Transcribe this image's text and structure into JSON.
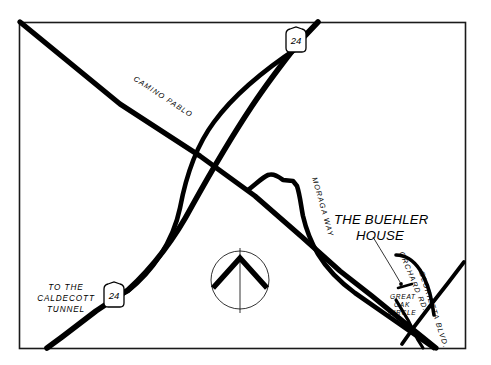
{
  "map": {
    "title": "The Buehler House Location Map",
    "background_color": "#ffffff",
    "ink_color": "#000000",
    "border_color": "#1a1a1a",
    "place_label": {
      "line1": "THE BUEHLER",
      "line2": "HOUSE"
    },
    "destination_label": {
      "line1": "TO THE",
      "line2": "CALDECOTT",
      "line3": "TUNNEL"
    },
    "roads": [
      {
        "id": "camino-pablo",
        "name": "CAMINO PABLO",
        "label": "CAMINO PABLO"
      },
      {
        "id": "highway-24",
        "name": "HIGHWAY 24",
        "label": "24"
      },
      {
        "id": "moraga-way",
        "name": "MORAGA WAY",
        "label": "MORAGA WAY"
      },
      {
        "id": "orchard-rd",
        "name": "ORCHARD RD.",
        "label": "ORCHARD RD."
      },
      {
        "id": "glorietta-blvd",
        "name": "GLORIETTA BLVD.",
        "label": "GLORIETTA BLVD."
      },
      {
        "id": "great-oak-circle",
        "name": "GREAT OAK CIRCLE",
        "label": "GREAT\nOAK\nCIRCLE"
      }
    ],
    "street_labels": {
      "camino_pablo": "CAMINO PABLO",
      "moraga_way": "MORAGA WAY",
      "orchard_rd": "ORCHARD RD.",
      "glorietta_blvd": "GLORIETTA BLVD.",
      "great_oak_circle_line1": "GREAT",
      "great_oak_circle_line2": "OAK",
      "great_oak_circle_line3": "CIRCLE"
    },
    "shields": [
      {
        "id": "shield-top",
        "route": "24",
        "x": 296,
        "y": 43
      },
      {
        "id": "shield-bottom",
        "route": "24",
        "x": 114,
        "y": 298
      }
    ],
    "compass": {
      "name": "north-arrow",
      "direction": "north",
      "center_x": 240,
      "center_y": 280,
      "radius": 29
    }
  }
}
